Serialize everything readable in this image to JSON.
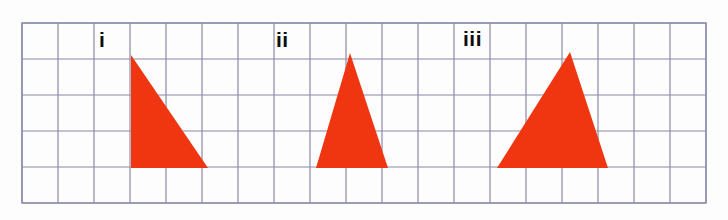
{
  "figure": {
    "background_color": "#fdfdfd",
    "width": 728,
    "height": 220
  },
  "grid": {
    "origin_x": 22,
    "origin_y": 23,
    "cell_size": 36,
    "columns": 19,
    "rows": 5,
    "line_color": "#8a8aa8",
    "border_color": "#8a8aa8",
    "line_width": 1.2
  },
  "shapes": [
    {
      "label": "i",
      "type": "triangle",
      "fill_color": "#f03610",
      "description": "right triangle, vertical left side",
      "points": "131,55 131,168 208,168",
      "base_cells": 2,
      "height_cells": 3
    },
    {
      "label": "ii",
      "type": "triangle",
      "fill_color": "#f03610",
      "description": "isosceles triangle",
      "points": "350,53 316,168 388,168",
      "base_cells": 2,
      "height_cells": 3
    },
    {
      "label": "iii",
      "type": "triangle",
      "fill_color": "#f03610",
      "description": "isosceles triangle, wider base",
      "points": "570,52 497,168 608,168",
      "base_cells": 3,
      "height_cells": 3
    }
  ],
  "labels": {
    "first": "i",
    "second": "ii",
    "third": "iii"
  }
}
